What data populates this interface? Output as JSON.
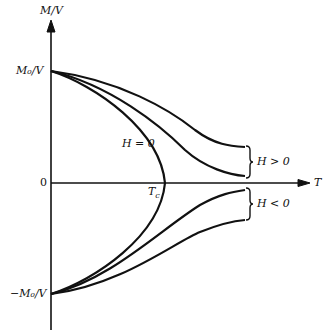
{
  "diagram": {
    "y_axis_label": "M/V",
    "x_axis_label": "T",
    "origin_label": "0",
    "top_value_label": "M₀/V",
    "bottom_value_label": "−M₀/V",
    "critical_temp_label": "T",
    "critical_temp_subscript": "c",
    "curve_zero_field_label": "H = 0",
    "group_positive_label": "H > 0",
    "group_negative_label": "H < 0"
  }
}
